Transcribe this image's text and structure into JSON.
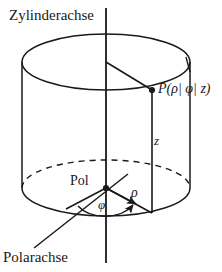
{
  "figure": {
    "background_color": "#ffffff",
    "stroke_color": "#1a1a1a"
  },
  "labels": {
    "cylinder_axis": "Zylinderachse",
    "polar_axis": "Polarachse",
    "pole": "Pol",
    "point": "P(ρ| φ| z)",
    "height": "z",
    "radius": "ρ",
    "angle": "φ"
  },
  "geometry": {
    "axis_x": 106,
    "axis_top_y": 8,
    "axis_bottom_y": 263,
    "top_ellipse": {
      "cx": 106,
      "cy": 62,
      "rx": 84,
      "ry": 28
    },
    "bottom_ellipse": {
      "cx": 106,
      "cy": 188,
      "rx": 84,
      "ry": 28
    },
    "pole_point": {
      "x": 106,
      "y": 188
    },
    "point_p": {
      "x": 152,
      "y": 90
    },
    "point_p_base": {
      "x": 152,
      "y": 212
    },
    "left_wall_x": 22,
    "right_wall_x": 190,
    "polar_axis_start": {
      "x": 36,
      "y": 246
    },
    "polar_axis_end": {
      "x": 126,
      "y": 175
    }
  },
  "elements": {
    "cylinder": "cylinder-body",
    "vertical_axis": "cylinder-axis-line",
    "dashed_arc": "hidden-base-arc",
    "radius_arrow": "rho-arrow",
    "angle_arc": "phi-arc-arrow",
    "top_radius_line": "top-radius-line",
    "height_line": "z-height-line"
  }
}
